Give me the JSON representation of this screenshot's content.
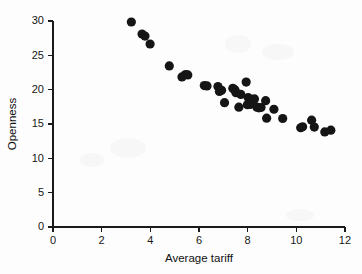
{
  "chart_data": {
    "type": "scatter",
    "title": "",
    "xlabel": "Average tariff",
    "ylabel": "Openness",
    "xlim": [
      0,
      12
    ],
    "ylim": [
      0,
      30
    ],
    "xticks": [
      0,
      2,
      4,
      6,
      8,
      10,
      12
    ],
    "yticks": [
      0,
      5,
      10,
      15,
      20,
      25,
      30
    ],
    "xtick_labels": [
      "0",
      "2",
      "4",
      "6",
      "8",
      "10",
      "12"
    ],
    "ytick_labels": [
      "0",
      "5",
      "10",
      "15",
      "20",
      "25",
      "30"
    ],
    "grid": false,
    "legend": null,
    "marker": "filled-circle",
    "marker_color": "#151515",
    "marker_size": 4.6,
    "series": [
      {
        "name": "countries",
        "points": [
          [
            3.22,
            29.85
          ],
          [
            3.66,
            28.1
          ],
          [
            3.78,
            27.8
          ],
          [
            3.99,
            26.65
          ],
          [
            4.78,
            23.45
          ],
          [
            5.3,
            21.85
          ],
          [
            5.45,
            22.2
          ],
          [
            5.54,
            22.15
          ],
          [
            6.22,
            20.6
          ],
          [
            6.33,
            20.55
          ],
          [
            6.78,
            20.45
          ],
          [
            6.84,
            19.75
          ],
          [
            6.93,
            19.9
          ],
          [
            7.05,
            18.1
          ],
          [
            7.39,
            20.2
          ],
          [
            7.44,
            20.05
          ],
          [
            7.48,
            19.95
          ],
          [
            7.52,
            19.55
          ],
          [
            7.64,
            17.45
          ],
          [
            7.72,
            19.3
          ],
          [
            7.94,
            21.1
          ],
          [
            7.99,
            17.8
          ],
          [
            8.02,
            18.85
          ],
          [
            8.1,
            17.85
          ],
          [
            8.28,
            18.65
          ],
          [
            8.38,
            17.45
          ],
          [
            8.46,
            17.35
          ],
          [
            8.55,
            17.4
          ],
          [
            8.74,
            18.4
          ],
          [
            8.78,
            15.85
          ],
          [
            9.08,
            17.15
          ],
          [
            9.44,
            15.8
          ],
          [
            10.18,
            14.45
          ],
          [
            10.26,
            14.6
          ],
          [
            10.63,
            15.55
          ],
          [
            10.74,
            14.55
          ],
          [
            11.17,
            13.85
          ],
          [
            11.42,
            14.1
          ]
        ]
      }
    ]
  },
  "geometry": {
    "plot_left_px": 53,
    "plot_bottom_px": 227,
    "px_per_x_unit": 24.33,
    "px_per_y_unit": 6.867,
    "x_axis_right_px": 345,
    "y_axis_top_px": 21
  }
}
